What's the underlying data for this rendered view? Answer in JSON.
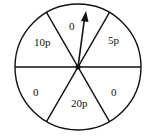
{
  "diagram": {
    "type": "spinner",
    "sectors": [
      {
        "position": "top",
        "label": "0"
      },
      {
        "position": "upper-right",
        "label": "5p"
      },
      {
        "position": "lower-right",
        "label": "0"
      },
      {
        "position": "bottom",
        "label": "20p"
      },
      {
        "position": "lower-left",
        "label": "0"
      },
      {
        "position": "upper-left",
        "label": "10p"
      }
    ],
    "pointer": {
      "icon": "arrow-pointer-icon",
      "points_to": "top"
    }
  }
}
